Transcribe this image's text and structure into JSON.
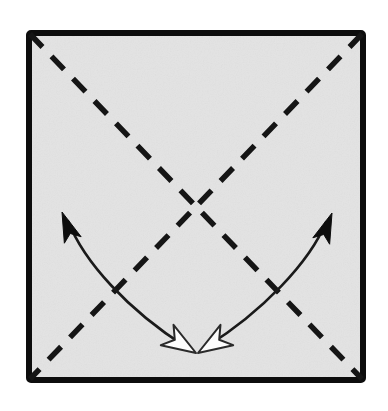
{
  "figure": {
    "canvas": {
      "width": 388,
      "height": 411,
      "background": "#ffffff"
    }
  },
  "colors": {
    "paper_fill": "#e3e3e3",
    "paper_border": "#0d0d0d",
    "crease_line": "#151515",
    "arrow_stroke": "#1a1a1a",
    "arrowhead_solid_fill": "#0d0d0d",
    "arrowhead_hollow_fill": "#fdfdfd",
    "arrowhead_hollow_stroke": "#2a2a2a"
  },
  "paper": {
    "label": "paper-square",
    "left": 26,
    "top": 30,
    "right": 366,
    "bottom": 383,
    "border_width": 6,
    "corner_radius": 2
  },
  "creases": {
    "style": "dashed",
    "dash_length": 18,
    "dash_gap": 13,
    "stroke_width": 5.5,
    "lines": [
      {
        "name": "crease-diagonal-tl-br",
        "from": [
          30,
          34
        ],
        "to": [
          362,
          379
        ],
        "kind": "valley-fold"
      },
      {
        "name": "crease-diagonal-tr-bl",
        "from": [
          362,
          34
        ],
        "to": [
          30,
          379
        ],
        "kind": "valley-fold"
      }
    ],
    "intersection": [
      196,
      207
    ]
  },
  "motion_arrows": [
    {
      "name": "fold-arrow-left",
      "description": "Curved double-headed arrow sweeping from upper-left down to bottom center",
      "stroke_width": 2.6,
      "path": "M 68 221 C 84 262, 128 310, 186 347",
      "head_start": {
        "type": "solid",
        "tip": [
          62,
          212
        ],
        "angle_deg": 249
      },
      "head_end": {
        "type": "hollow",
        "tip": [
          196,
          353
        ],
        "angle_deg": 32
      }
    },
    {
      "name": "fold-arrow-right",
      "description": "Curved double-headed arrow sweeping from upper-right down to bottom center",
      "stroke_width": 2.6,
      "path": "M 326 222 C 310 262, 262 312, 206 347",
      "head_start": {
        "type": "solid",
        "tip": [
          332,
          213
        ],
        "angle_deg": 291
      },
      "head_end": {
        "type": "hollow",
        "tip": [
          198,
          353
        ],
        "angle_deg": 148
      }
    }
  ],
  "arrowhead_geometry": {
    "solid": {
      "length": 30,
      "half_width": 9,
      "notch": 7
    },
    "hollow": {
      "length": 34,
      "half_width": 12,
      "notch": 9,
      "stroke_width": 2
    }
  }
}
